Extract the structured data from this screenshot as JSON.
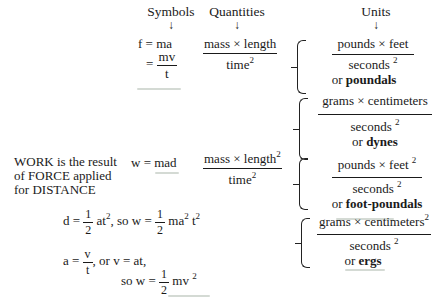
{
  "headers": {
    "symbols": "Symbols",
    "quantities": "Quantities",
    "units": "Units",
    "arrow": "↓"
  },
  "force": {
    "eq1": "f = ma",
    "eq2_lhs": "=",
    "eq2_num": "mv",
    "eq2_den": "t",
    "quantity_num": "mass × length",
    "quantity_den": "time",
    "quantity_den_exp": "2",
    "units": [
      {
        "num": "pounds × feet",
        "den": "seconds",
        "den_exp": "2",
        "or": "or",
        "name": "poundals"
      },
      {
        "num": "grams × centimeters",
        "den": "seconds",
        "den_exp": "2",
        "or": "or",
        "name": "dynes"
      }
    ]
  },
  "work": {
    "description": [
      "WORK is the result",
      "of FORCE applied",
      "for DISTANCE"
    ],
    "eq": "w = mad",
    "quantity_num": "mass × length",
    "quantity_num_exp": "2",
    "quantity_den": "time",
    "quantity_den_exp": "2",
    "units": [
      {
        "num": "pounds × feet",
        "num_exp": "2",
        "den": "seconds",
        "den_exp": "2",
        "or": "or",
        "name": "foot-poundals"
      },
      {
        "num": "grams × centimeters",
        "num_exp": "2",
        "den": "seconds",
        "den_exp": "2",
        "or": "or",
        "name": "ergs"
      }
    ]
  },
  "derivation": {
    "line1_a": "d =",
    "line1_frac_num": "1",
    "line1_frac_den": "2",
    "line1_b": "at",
    "line1_b_exp": "2",
    "line1_c": ", so w =",
    "line1_d": "ma",
    "line1_d_exp": "2",
    "line1_e": "t",
    "line1_e_exp": "2",
    "line2_a": "a =",
    "line2_frac_num": "v",
    "line2_frac_den": "t",
    "line2_b": ", or v = at,",
    "line3_a": "so w =",
    "line3_frac_num": "1",
    "line3_frac_den": "2",
    "line3_b": "mv",
    "line3_b_exp": "2"
  }
}
